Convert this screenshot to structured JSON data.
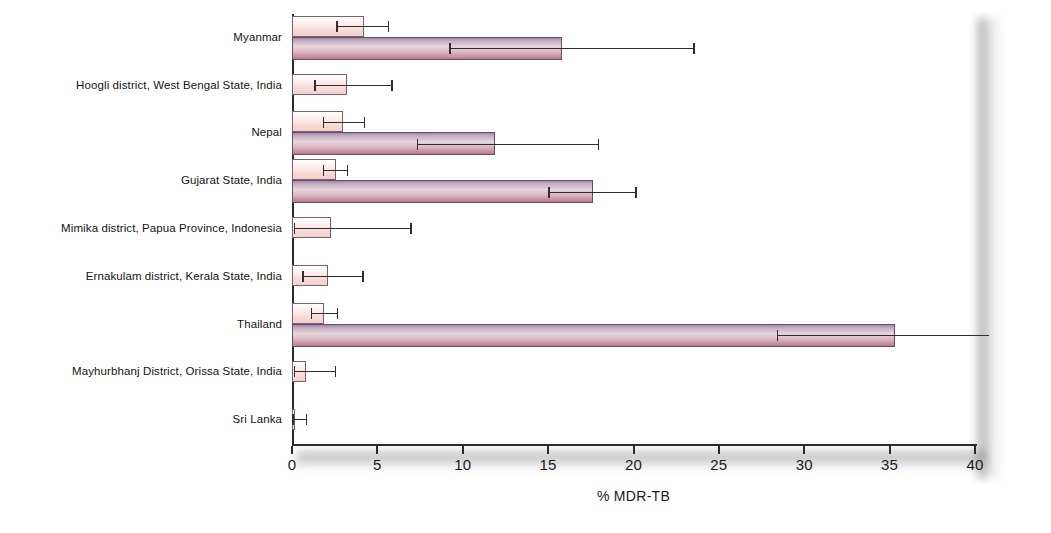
{
  "chart_data": {
    "type": "bar",
    "orientation": "horizontal",
    "title": "",
    "xlabel": "% MDR-TB",
    "ylabel": "",
    "xlim": [
      0,
      40
    ],
    "xticks": [
      0,
      5,
      10,
      15,
      20,
      25,
      30,
      35,
      40
    ],
    "xtick_labels": [
      "0",
      "5",
      "10",
      "15",
      "20",
      "25",
      "30",
      "35",
      "40"
    ],
    "grid": false,
    "legend": "none",
    "categories": [
      "Myanmar",
      "Hoogli district, West Bengal State, India",
      "Nepal",
      "Gujarat State, India",
      "Mimika district, Papua Province, Indonesia",
      "Ernakulam district, Kerala State, India",
      "Thailand",
      "Mayhurbhanj District, Orissa State, India",
      "Sri Lanka"
    ],
    "series": [
      {
        "name": "New cases",
        "color": "#f6d9d6",
        "values": [
          4.2,
          3.2,
          3.0,
          2.6,
          2.3,
          2.1,
          1.9,
          0.8,
          0.2
        ],
        "ci_low": [
          2.6,
          1.3,
          1.8,
          1.8,
          0.1,
          0.6,
          1.1,
          0.1,
          0.0
        ],
        "ci_high": [
          5.7,
          5.9,
          4.3,
          3.3,
          7.0,
          4.2,
          2.7,
          2.6,
          0.9
        ]
      },
      {
        "name": "Previously treated cases",
        "color": "#b8788f",
        "values": [
          15.8,
          null,
          11.9,
          17.6,
          null,
          null,
          35.3,
          null,
          null
        ],
        "ci_low": [
          9.2,
          null,
          7.3,
          15.0,
          null,
          null,
          28.4,
          null,
          null
        ],
        "ci_high": [
          23.6,
          null,
          18.0,
          20.2,
          null,
          null,
          41.5,
          null,
          null
        ],
        "ci_high_clipped": [
          false,
          null,
          false,
          false,
          null,
          null,
          true,
          null,
          null
        ]
      }
    ]
  }
}
